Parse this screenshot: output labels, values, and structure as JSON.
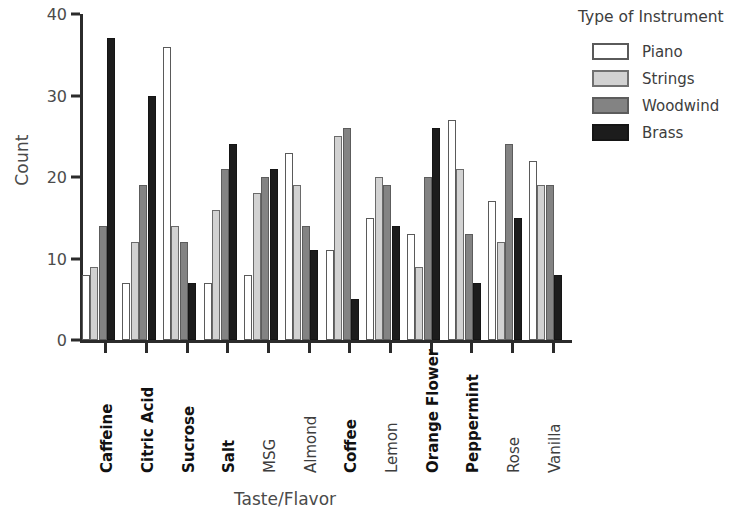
{
  "chart_data": {
    "type": "bar",
    "title": "",
    "xlabel": "Taste/Flavor",
    "ylabel": "Count",
    "ylim": [
      0,
      40
    ],
    "yticks": [
      0,
      10,
      20,
      30,
      40
    ],
    "grid": false,
    "legend_position": "right",
    "legend_title": "Type of Instrument",
    "categories": [
      "Caffeine",
      "Citric Acid",
      "Sucrose",
      "Salt",
      "MSG",
      "Almond",
      "Coffee",
      "Lemon",
      "Orange Flower",
      "Peppermint",
      "Rose",
      "Vanilla"
    ],
    "category_emphasis": [
      true,
      true,
      true,
      true,
      false,
      false,
      true,
      false,
      true,
      true,
      false,
      false
    ],
    "series": [
      {
        "name": "Piano",
        "color": "#ffffff",
        "values": [
          8,
          7,
          36,
          7,
          8,
          23,
          11,
          15,
          13,
          27,
          17,
          22
        ]
      },
      {
        "name": "Strings",
        "color": "#d2d2d2",
        "values": [
          9,
          12,
          14,
          16,
          18,
          19,
          25,
          20,
          9,
          21,
          12,
          19
        ]
      },
      {
        "name": "Woodwind",
        "color": "#838383",
        "values": [
          14,
          19,
          12,
          21,
          20,
          14,
          26,
          19,
          20,
          13,
          24,
          19
        ]
      },
      {
        "name": "Brass",
        "color": "#1c1c1c",
        "values": [
          37,
          30,
          7,
          24,
          21,
          11,
          5,
          14,
          26,
          7,
          15,
          8
        ]
      }
    ]
  }
}
